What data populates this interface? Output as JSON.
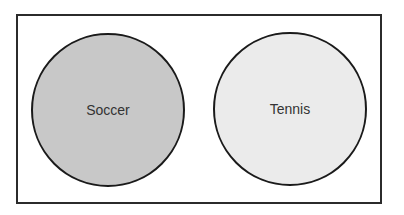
{
  "diagram": {
    "type": "venn",
    "frame": {
      "x": 17,
      "y": 15,
      "width": 364,
      "height": 188,
      "stroke": "#2b2b2b",
      "fill": "#ffffff"
    },
    "sets": [
      {
        "label": "Soccer",
        "cx": 108,
        "cy": 110,
        "r": 76,
        "fill": "#c8c8c8",
        "stroke": "#1a1a1a"
      },
      {
        "label": "Tennis",
        "cx": 290,
        "cy": 109,
        "r": 76,
        "fill": "#ebebeb",
        "stroke": "#1a1a1a"
      }
    ],
    "overlap": "none"
  }
}
